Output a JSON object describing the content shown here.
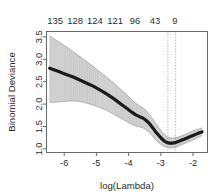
{
  "chart_data": {
    "type": "line",
    "title": "",
    "xlabel": "log(Lambda)",
    "ylabel": "Binomial Deviance",
    "xlim": [
      -6.55,
      -1.55
    ],
    "ylim": [
      0.92,
      3.62
    ],
    "grid": false,
    "legend": null,
    "x_ticks": [
      "-6",
      "-5",
      "-4",
      "-3",
      "-2"
    ],
    "x_tick_values": [
      -6,
      -5,
      -4,
      -3,
      -2
    ],
    "y_ticks": [
      "1.0",
      "1.5",
      "2.0",
      "2.5",
      "3.0",
      "3.5"
    ],
    "y_tick_values": [
      1.0,
      1.5,
      2.0,
      2.5,
      3.0,
      3.5
    ],
    "top_axis_labels": [
      "135",
      "128",
      "124",
      "121",
      "96",
      "43",
      "9"
    ],
    "top_axis_positions": [
      -6.28,
      -5.66,
      -5.05,
      -4.42,
      -3.8,
      -3.18,
      -2.56
    ],
    "series": [
      {
        "name": "Mean Binomial Deviance",
        "color": "#1a1a1a",
        "x": [
          -6.45,
          -6.3,
          -6.15,
          -6.0,
          -5.85,
          -5.7,
          -5.55,
          -5.4,
          -5.25,
          -5.1,
          -4.95,
          -4.8,
          -4.65,
          -4.5,
          -4.35,
          -4.2,
          -4.05,
          -3.9,
          -3.78,
          -3.66,
          -3.56,
          -3.46,
          -3.36,
          -3.26,
          -3.16,
          -3.06,
          -2.96,
          -2.88,
          -2.8,
          -2.72,
          -2.64,
          -2.56,
          -2.48,
          -2.4,
          -2.3,
          -2.2,
          -2.1,
          -2.0,
          -1.9,
          -1.8,
          -1.72
        ],
        "values": [
          2.8,
          2.76,
          2.72,
          2.68,
          2.64,
          2.6,
          2.55,
          2.5,
          2.45,
          2.4,
          2.34,
          2.28,
          2.21,
          2.14,
          2.06,
          1.98,
          1.9,
          1.82,
          1.76,
          1.72,
          1.69,
          1.64,
          1.57,
          1.48,
          1.38,
          1.3,
          1.22,
          1.17,
          1.14,
          1.13,
          1.13,
          1.14,
          1.16,
          1.18,
          1.21,
          1.24,
          1.27,
          1.3,
          1.33,
          1.36,
          1.38
        ]
      }
    ],
    "error_band": {
      "name": "Cross-validation standard error bars",
      "color": "#a8a8a8",
      "x": [
        -6.45,
        -6.3,
        -6.15,
        -6.0,
        -5.85,
        -5.7,
        -5.55,
        -5.4,
        -5.25,
        -5.1,
        -4.95,
        -4.8,
        -4.65,
        -4.5,
        -4.35,
        -4.2,
        -4.05,
        -3.9,
        -3.78,
        -3.66,
        -3.56,
        -3.46,
        -3.36,
        -3.26,
        -3.16,
        -3.06,
        -2.96,
        -2.88,
        -2.8,
        -2.72,
        -2.64,
        -2.56,
        -2.48,
        -2.4,
        -2.3,
        -2.2,
        -2.1,
        -2.0,
        -1.9,
        -1.8,
        -1.72
      ],
      "upper": [
        3.52,
        3.45,
        3.38,
        3.31,
        3.24,
        3.16,
        3.08,
        3.0,
        2.92,
        2.84,
        2.75,
        2.67,
        2.58,
        2.49,
        2.4,
        2.3,
        2.2,
        2.1,
        2.02,
        1.96,
        1.92,
        1.86,
        1.78,
        1.68,
        1.57,
        1.47,
        1.38,
        1.31,
        1.27,
        1.25,
        1.24,
        1.25,
        1.26,
        1.28,
        1.31,
        1.34,
        1.37,
        1.4,
        1.43,
        1.45,
        1.47
      ],
      "lower": [
        2.04,
        2.04,
        2.05,
        2.06,
        2.07,
        2.07,
        2.06,
        2.04,
        2.01,
        1.98,
        1.94,
        1.9,
        1.85,
        1.79,
        1.73,
        1.67,
        1.61,
        1.55,
        1.51,
        1.49,
        1.47,
        1.43,
        1.37,
        1.29,
        1.2,
        1.14,
        1.08,
        1.05,
        1.03,
        1.02,
        1.02,
        1.03,
        1.05,
        1.08,
        1.11,
        1.14,
        1.17,
        1.2,
        1.23,
        1.27,
        1.3
      ]
    },
    "vlines": [
      {
        "name": "lambda.min",
        "x": -2.78,
        "style": "dotted",
        "color": "#9a9a9a"
      },
      {
        "name": "lambda.1se",
        "x": -2.54,
        "style": "dotted",
        "color": "#9a9a9a"
      }
    ]
  }
}
